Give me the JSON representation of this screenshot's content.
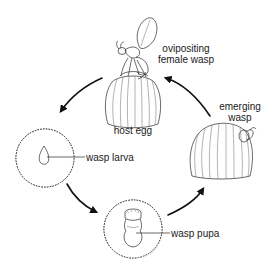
{
  "diagram": {
    "type": "life-cycle",
    "labels": {
      "ovipositing_line1": "ovipositing",
      "ovipositing_line2": "female wasp",
      "host_egg": "host egg",
      "emerging_line1": "emerging",
      "emerging_line2": "wasp",
      "wasp_larva": "wasp larva",
      "wasp_pupa": "wasp pupa"
    },
    "stages": [
      {
        "name": "ovipositing female wasp on host egg",
        "label": "host egg"
      },
      {
        "name": "wasp larva",
        "label": "wasp larva"
      },
      {
        "name": "wasp pupa",
        "label": "wasp pupa"
      },
      {
        "name": "emerging wasp",
        "label": "emerging wasp"
      }
    ],
    "flow": [
      "host egg",
      "wasp larva",
      "wasp pupa",
      "emerging wasp",
      "host egg"
    ],
    "colors": {
      "line": "#2a2a2a",
      "arrow": "#111111",
      "background": "#ffffff",
      "stipple": "#e9e9e9"
    }
  }
}
